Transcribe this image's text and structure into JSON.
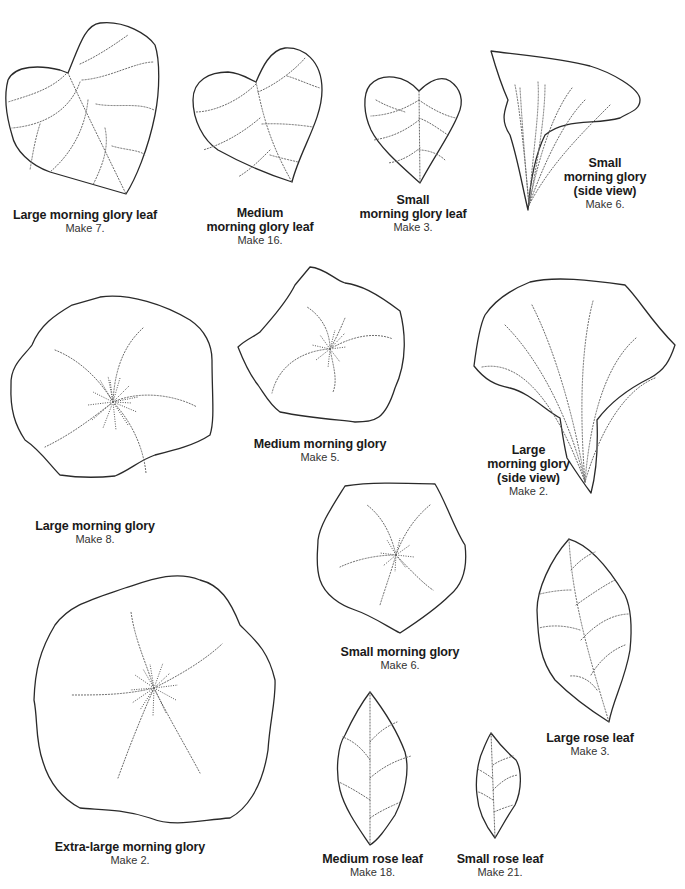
{
  "templates": [
    {
      "id": "large-morning-glory-leaf",
      "title_lines": [
        "Large morning glory leaf"
      ],
      "quantity": "Make 7."
    },
    {
      "id": "medium-morning-glory-leaf",
      "title_lines": [
        "Medium",
        "morning glory leaf"
      ],
      "quantity": "Make 16."
    },
    {
      "id": "small-morning-glory-leaf",
      "title_lines": [
        "Small",
        "morning glory leaf"
      ],
      "quantity": "Make 3."
    },
    {
      "id": "small-morning-glory-side-view",
      "title_lines": [
        "Small",
        "morning glory",
        "(side view)"
      ],
      "quantity": "Make 6."
    },
    {
      "id": "large-morning-glory",
      "title_lines": [
        "Large morning glory"
      ],
      "quantity": "Make 8."
    },
    {
      "id": "medium-morning-glory",
      "title_lines": [
        "Medium morning glory"
      ],
      "quantity": "Make 5."
    },
    {
      "id": "large-morning-glory-side-view",
      "title_lines": [
        "Large",
        "morning glory",
        "(side view)"
      ],
      "quantity": "Make 2."
    },
    {
      "id": "small-morning-glory",
      "title_lines": [
        "Small morning glory"
      ],
      "quantity": "Make 6."
    },
    {
      "id": "large-rose-leaf",
      "title_lines": [
        "Large rose leaf"
      ],
      "quantity": "Make 3."
    },
    {
      "id": "extra-large-morning-glory",
      "title_lines": [
        "Extra-large morning glory"
      ],
      "quantity": "Make 2."
    },
    {
      "id": "medium-rose-leaf",
      "title_lines": [
        "Medium rose leaf"
      ],
      "quantity": "Make 18."
    },
    {
      "id": "small-rose-leaf",
      "title_lines": [
        "Small rose leaf"
      ],
      "quantity": "Make 21."
    }
  ]
}
